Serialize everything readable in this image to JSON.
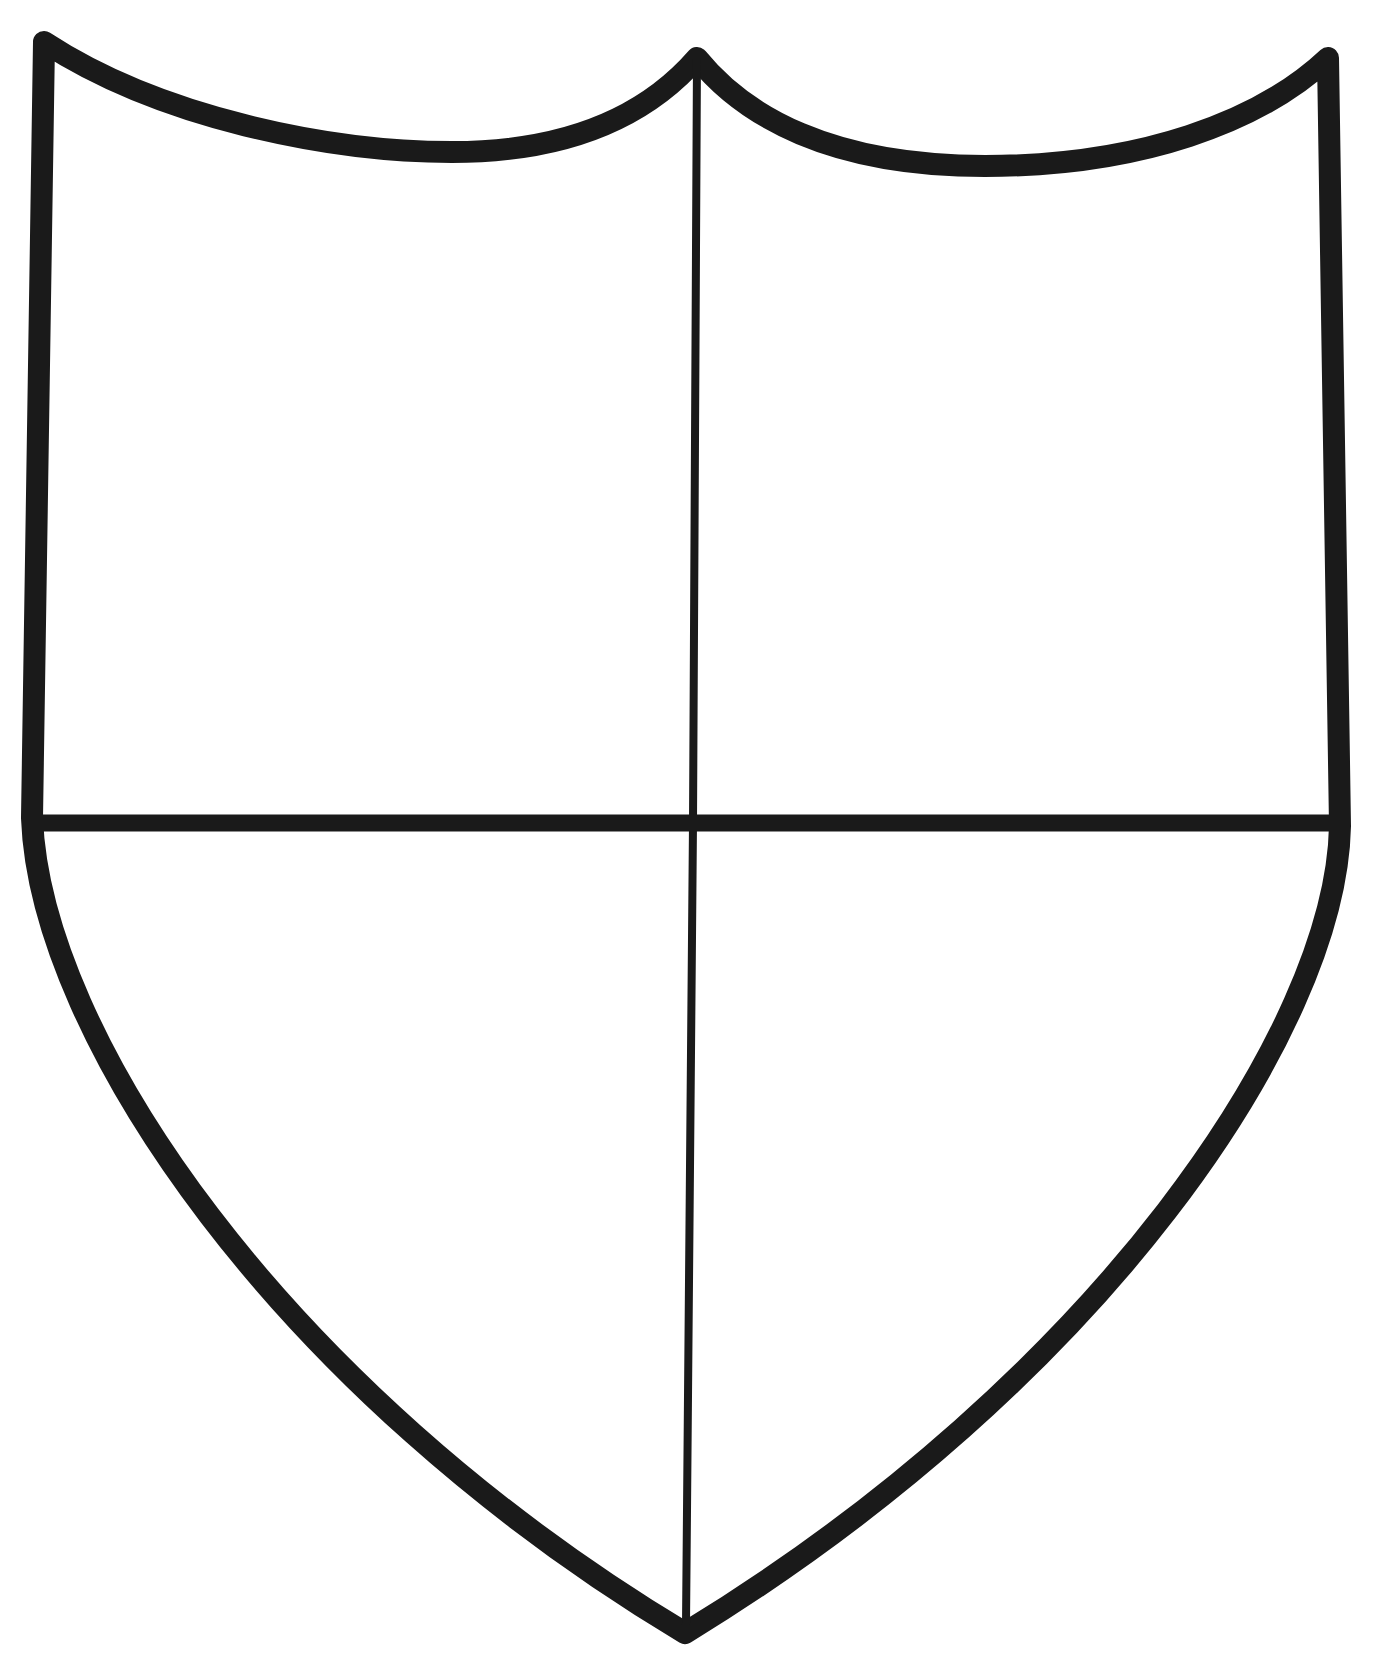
{
  "document": {
    "title": "Shield Outline",
    "kind": "line-drawing",
    "subject": "heraldic-shield-quartered",
    "background_color": "#ffffff",
    "ink_color": "#1a1a1a",
    "canvas": {
      "width": 1377,
      "height": 1665
    }
  },
  "drawing": {
    "description": "Black ink outline of a heraldic shield (escutcheon) divided into four quarters by a vertical pale line and a horizontal fess line.",
    "stroke": {
      "outline_color": "#1a1a1a",
      "outline_width": 22,
      "division_color": "#1a1a1a",
      "vertical_division_width": 8,
      "horizontal_division_width": 17,
      "linecap": "round",
      "linejoin": "round"
    },
    "geometry": {
      "top_left_corner": {
        "x": 44,
        "y": 42
      },
      "top_right_corner": {
        "x": 1328,
        "y": 58
      },
      "top_center_peak": {
        "x": 697,
        "y": 58
      },
      "left_dip_lowest": {
        "x": 452,
        "y": 152
      },
      "right_dip_lowest": {
        "x": 985,
        "y": 166
      },
      "left_waist": {
        "x": 32,
        "y": 818
      },
      "right_waist": {
        "x": 1340,
        "y": 826
      },
      "bottom_point": {
        "x": 685,
        "y": 1633
      },
      "fess_line_y": 823,
      "pale_line_x": 693
    },
    "paths": {
      "outline": "M 44 42 C 160 118 330 152 452 152 C 574 152 650 112 697 58 C 744 116 830 166 985 166 C 1140 166 1260 122 1328 58 L 1340 826 C 1336 1030 1100 1380 685 1633 C 280 1390 40 1035 32 818 Z",
      "pale": "M 697 58 L 693 823 L 686 1625",
      "fess": "M 33 823 L 1339 823"
    },
    "quarters": [
      {
        "name": "dexter-chief",
        "position": "top-left"
      },
      {
        "name": "sinister-chief",
        "position": "top-right"
      },
      {
        "name": "dexter-base",
        "position": "bottom-left"
      },
      {
        "name": "sinister-base",
        "position": "bottom-right"
      }
    ]
  }
}
